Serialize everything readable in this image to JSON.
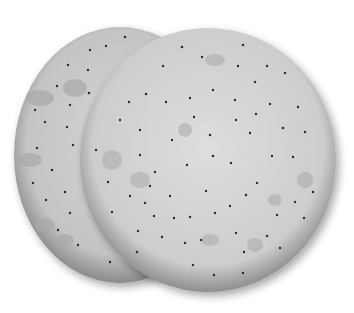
{
  "image": {
    "subject": "two round water crackers",
    "background": "#ffffff",
    "crackers": [
      {
        "name": "back-cracker",
        "cx": 120,
        "cy": 155,
        "r": 106,
        "base": "#c9c9c9",
        "edge": "#8a8a8a"
      },
      {
        "name": "front-cracker",
        "cx": 208,
        "cy": 160,
        "r": 128,
        "base": "#d4d4d4",
        "edge": "#8e8e8e"
      }
    ]
  }
}
